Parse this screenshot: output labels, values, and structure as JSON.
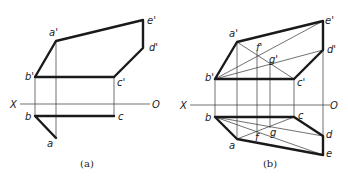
{
  "figure_a": {
    "caption": "(a)",
    "axis": {
      "left": "X",
      "right": "O"
    },
    "labels": {
      "a1": "a'",
      "b1": "b'",
      "c1": "c'",
      "d1": "d'",
      "e1": "e'",
      "b": "b",
      "c": "c",
      "a": "a"
    }
  },
  "figure_b": {
    "caption": "(b)",
    "axis": {
      "left": "X",
      "right": "O"
    },
    "labels": {
      "a1": "a'",
      "b1": "b'",
      "c1": "c'",
      "d1": "d'",
      "e1": "e'",
      "f1": "f'",
      "g1": "g'",
      "b": "b",
      "c": "c",
      "a": "a",
      "d": "d",
      "e": "e",
      "f": "f",
      "g": "g"
    }
  }
}
